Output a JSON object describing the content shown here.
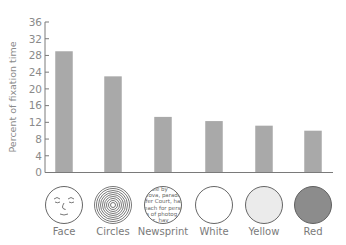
{
  "chart_data": {
    "type": "bar",
    "title": "",
    "xlabel": "",
    "ylabel": "Percent of fixation time",
    "ylim": [
      0,
      36
    ],
    "yticks": [
      0,
      4,
      8,
      12,
      16,
      20,
      24,
      28,
      32,
      36
    ],
    "categories": [
      "Face",
      "Circles",
      "Newsprint",
      "White",
      "Yellow",
      "Red"
    ],
    "values": [
      29,
      23,
      13.3,
      12.3,
      11.2,
      10
    ],
    "grid": false,
    "legend": null,
    "bar_color": "#a9a9a9",
    "stimuli": [
      {
        "category": "Face",
        "icon": "face-drawing",
        "fill": "#ffffff"
      },
      {
        "category": "Circles",
        "icon": "concentric-circles",
        "fill": "#ffffff"
      },
      {
        "category": "Newsprint",
        "icon": "newsprint-text",
        "fill": "#ffffff",
        "text_lines": [
          "uable by",
          "slova, parade",
          "ifer Court, has",
          "each for perse",
          "ts of photog",
          "mer, hav"
        ]
      },
      {
        "category": "White",
        "icon": "plain-disc",
        "fill": "#ffffff"
      },
      {
        "category": "Yellow",
        "icon": "plain-disc",
        "fill": "#ebebeb"
      },
      {
        "category": "Red",
        "icon": "plain-disc",
        "fill": "#8c8c8c"
      }
    ]
  }
}
